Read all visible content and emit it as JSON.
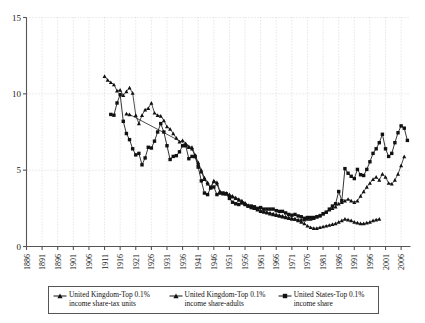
{
  "chart_data": {
    "type": "line",
    "title": "",
    "subtitle": "",
    "xlabel": "",
    "ylabel": "",
    "xlim": [
      1886,
      2009
    ],
    "ylim": [
      0,
      15
    ],
    "grid": "dotted vertical gridlines at every 5-year tick; dotted horizontal gridlines at 5, 10, 15",
    "legend_position": "bottom-center, boxed, three entries in one row",
    "y_ticks": [
      "0",
      "5",
      "10",
      "15"
    ],
    "y_tick_values": [
      0,
      5,
      10,
      15
    ],
    "x_ticks": [
      "1886",
      "1891",
      "1896",
      "1901",
      "1906",
      "1911",
      "1916",
      "1921",
      "1926",
      "1931",
      "1936",
      "1941",
      "1946",
      "1951",
      "1956",
      "1961",
      "1966",
      "1971",
      "1976",
      "1981",
      "1986",
      "1991",
      "1996",
      "2001",
      "2006"
    ],
    "x_tick_values": [
      1886,
      1891,
      1896,
      1901,
      1906,
      1911,
      1916,
      1921,
      1926,
      1931,
      1936,
      1941,
      1946,
      1951,
      1956,
      1961,
      1966,
      1971,
      1976,
      1981,
      1986,
      1991,
      1996,
      2001,
      2006
    ],
    "series": [
      {
        "name": "United Kingdom-Top 0.1% income share-tax units",
        "marker": "triangle",
        "color": "#111111",
        "x": [
          1911,
          1912,
          1913,
          1914,
          1915,
          1916,
          1917,
          1918,
          1919,
          1920,
          1921,
          1922,
          1923,
          1924,
          1925,
          1926,
          1927,
          1928,
          1929,
          1930,
          1931,
          1932,
          1933,
          1934,
          1935,
          1936,
          1937,
          1938,
          1939,
          1940,
          1941,
          1942,
          1943,
          1944,
          1945,
          1946,
          1947,
          1948,
          1949,
          1950,
          1951,
          1952,
          1953,
          1954,
          1955,
          1956,
          1957,
          1958,
          1959,
          1960,
          1961,
          1962,
          1963,
          1964,
          1965,
          1966,
          1967,
          1968,
          1969,
          1970,
          1971,
          1972,
          1973,
          1974,
          1975,
          1976,
          1977,
          1978,
          1979,
          1980,
          1981,
          1982,
          1983,
          1984,
          1985,
          1986,
          1987,
          1988,
          1989,
          1990,
          1991,
          1992,
          1993,
          1994,
          1995,
          1996,
          1997,
          1998,
          1999
        ],
        "y": [
          11.15,
          10.9,
          10.75,
          10.6,
          10.2,
          10.25,
          9.9,
          10.15,
          10.4,
          10.05,
          8.6,
          8.05,
          8.6,
          8.95,
          9.05,
          9.4,
          8.75,
          8.6,
          8.55,
          8.25,
          7.85,
          7.7,
          7.4,
          7.1,
          6.85,
          6.95,
          6.75,
          6.55,
          6.5,
          6.0,
          5.5,
          5.0,
          4.5,
          4.2,
          3.9,
          4.3,
          4.2,
          3.6,
          3.5,
          3.5,
          3.4,
          3.3,
          3.2,
          3.1,
          3.0,
          2.85,
          2.7,
          2.6,
          2.5,
          2.45,
          2.35,
          2.3,
          2.25,
          2.2,
          2.15,
          2.1,
          2.05,
          2.0,
          1.95,
          1.9,
          1.85,
          1.8,
          1.7,
          1.6,
          1.5,
          1.35,
          1.25,
          1.2,
          1.2,
          1.25,
          1.3,
          1.35,
          1.4,
          1.45,
          1.5,
          1.6,
          1.7,
          1.8,
          1.75,
          1.7,
          1.6,
          1.55,
          1.5,
          1.5,
          1.55,
          1.6,
          1.7,
          1.75,
          1.8
        ]
      },
      {
        "name": "United Kingdom-Top 0.1% income share-adults",
        "marker": "triangle",
        "color": "#111111",
        "x": [
          1918,
          1919,
          1937,
          1938,
          1939,
          1940,
          1941,
          1942,
          1943,
          1944,
          1945,
          1946,
          1947,
          1948,
          1949,
          1950,
          1951,
          1952,
          1953,
          1954,
          1955,
          1956,
          1957,
          1958,
          1959,
          1960,
          1961,
          1962,
          1963,
          1964,
          1965,
          1966,
          1967,
          1968,
          1969,
          1970,
          1971,
          1972,
          1973,
          1974,
          1975,
          1976,
          1977,
          1978,
          1979,
          1980,
          1981,
          1982,
          1983,
          1984,
          1985,
          1986,
          1987,
          1988,
          1989,
          1990,
          1991,
          1992,
          1993,
          1994,
          1995,
          1996,
          1997,
          1998,
          1999,
          2000,
          2001,
          2002,
          2003,
          2004,
          2005,
          2006,
          2007
        ],
        "y": [
          8.7,
          8.65,
          6.7,
          6.5,
          6.4,
          5.9,
          5.4,
          4.9,
          4.4,
          4.1,
          3.85,
          4.25,
          4.1,
          3.55,
          3.45,
          3.45,
          3.35,
          3.25,
          3.15,
          3.05,
          2.95,
          2.8,
          2.65,
          2.55,
          2.5,
          2.4,
          2.3,
          2.25,
          2.2,
          2.15,
          2.1,
          2.05,
          2.0,
          1.95,
          1.9,
          1.85,
          1.8,
          1.8,
          1.75,
          1.75,
          1.75,
          1.8,
          1.8,
          1.85,
          1.95,
          2.05,
          2.15,
          2.25,
          2.4,
          2.5,
          2.6,
          2.8,
          2.9,
          3.0,
          3.1,
          3.0,
          2.9,
          3.0,
          3.3,
          3.6,
          3.9,
          4.15,
          4.4,
          4.55,
          4.35,
          4.75,
          4.55,
          4.15,
          4.1,
          4.35,
          4.75,
          5.3,
          5.9
        ]
      },
      {
        "name": "United States-Top 0.1% income share",
        "marker": "square",
        "color": "#111111",
        "x": [
          1913,
          1914,
          1915,
          1916,
          1917,
          1918,
          1919,
          1920,
          1921,
          1922,
          1923,
          1924,
          1925,
          1926,
          1927,
          1928,
          1929,
          1930,
          1931,
          1932,
          1933,
          1934,
          1935,
          1936,
          1937,
          1938,
          1939,
          1940,
          1941,
          1942,
          1943,
          1944,
          1945,
          1946,
          1947,
          1948,
          1949,
          1950,
          1951,
          1952,
          1953,
          1954,
          1955,
          1956,
          1957,
          1958,
          1959,
          1960,
          1961,
          1962,
          1963,
          1964,
          1965,
          1966,
          1967,
          1968,
          1969,
          1970,
          1971,
          1972,
          1973,
          1974,
          1975,
          1976,
          1977,
          1978,
          1979,
          1980,
          1981,
          1982,
          1983,
          1984,
          1985,
          1986,
          1987,
          1988,
          1989,
          1990,
          1991,
          1992,
          1993,
          1994,
          1995,
          1996,
          1997,
          1998,
          1999,
          2000,
          2001,
          2002,
          2003,
          2004,
          2005,
          2006,
          2007,
          2008
        ],
        "y": [
          8.65,
          8.6,
          9.4,
          9.95,
          8.2,
          7.4,
          7.0,
          6.4,
          6.0,
          6.1,
          5.35,
          5.8,
          6.5,
          6.45,
          6.9,
          7.5,
          8.05,
          7.5,
          6.6,
          5.7,
          5.9,
          5.95,
          6.2,
          6.6,
          6.6,
          5.75,
          5.9,
          5.9,
          5.2,
          4.3,
          3.5,
          3.4,
          3.85,
          3.9,
          3.4,
          3.5,
          3.5,
          3.45,
          3.15,
          2.9,
          2.8,
          2.75,
          2.85,
          2.75,
          2.65,
          2.65,
          2.6,
          2.5,
          2.55,
          2.45,
          2.45,
          2.45,
          2.45,
          2.35,
          2.3,
          2.3,
          2.2,
          2.1,
          2.05,
          2.1,
          2.0,
          1.95,
          1.85,
          1.9,
          1.9,
          1.9,
          1.95,
          2.0,
          2.15,
          2.25,
          2.45,
          2.65,
          2.8,
          3.6,
          3.0,
          5.1,
          4.8,
          4.6,
          4.45,
          5.05,
          4.7,
          4.65,
          5.05,
          5.55,
          6.1,
          6.4,
          6.8,
          7.35,
          6.4,
          5.9,
          6.1,
          6.8,
          7.45,
          7.9,
          7.75,
          6.95
        ]
      }
    ]
  },
  "axes": {
    "y_axis_name": "percent-share-axis",
    "x_axis_name": "year-axis"
  },
  "legend": {
    "entries": [
      {
        "line1": "United Kingdom-Top 0.1%",
        "line2": "income share-tax units",
        "marker": "triangle"
      },
      {
        "line1": "United Kingdom-Top 0.1%",
        "line2": "income share-adults",
        "marker": "triangle"
      },
      {
        "line1": "United States-Top 0.1%",
        "line2": "income share",
        "marker": "square"
      }
    ]
  },
  "colors": {
    "series": "#111111",
    "grid": "#c8c8c8",
    "axis": "#555555",
    "legend_border": "#555555",
    "background": "#ffffff"
  }
}
